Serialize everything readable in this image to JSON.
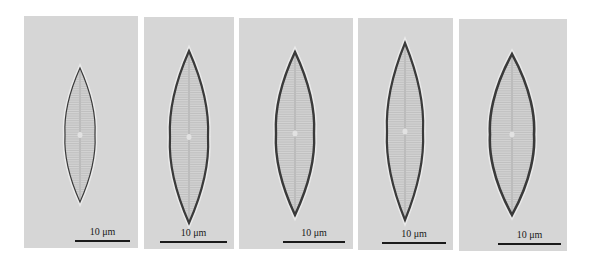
{
  "figure": {
    "background": "#ffffff",
    "panel_color": "#d6d6d6",
    "panels": [
      {
        "id": "a",
        "x": 24,
        "y": 16,
        "w": 114,
        "h": 232,
        "scale_label": "10 μm",
        "bar_x1": 75,
        "bar_x2": 130,
        "bar_y": 240,
        "cell": {
          "cx": 80,
          "top": 68,
          "bottom": 202,
          "half_w": 15,
          "stroke": 1.2
        }
      },
      {
        "id": "b",
        "x": 144,
        "y": 17,
        "w": 90,
        "h": 232,
        "scale_label": "10 μm",
        "bar_x1": 160,
        "bar_x2": 227,
        "bar_y": 241,
        "cell": {
          "cx": 189,
          "top": 51,
          "bottom": 223,
          "half_w": 19,
          "stroke": 2.2
        }
      },
      {
        "id": "c",
        "x": 239,
        "y": 18,
        "w": 114,
        "h": 231,
        "scale_label": "10 μm",
        "bar_x1": 283,
        "bar_x2": 345,
        "bar_y": 241,
        "cell": {
          "cx": 295,
          "top": 52,
          "bottom": 215,
          "half_w": 19,
          "stroke": 2.4
        }
      },
      {
        "id": "d",
        "x": 358,
        "y": 18,
        "w": 95,
        "h": 232,
        "scale_label": "10 μm",
        "bar_x1": 382,
        "bar_x2": 446,
        "bar_y": 242,
        "cell": {
          "cx": 405,
          "top": 43,
          "bottom": 220,
          "half_w": 18,
          "stroke": 2.2
        }
      },
      {
        "id": "e",
        "x": 459,
        "y": 19,
        "w": 108,
        "h": 232,
        "scale_label": "10 μm",
        "bar_x1": 498,
        "bar_x2": 561,
        "bar_y": 243,
        "cell": {
          "cx": 512,
          "top": 54,
          "bottom": 215,
          "half_w": 22,
          "stroke": 2.6
        }
      }
    ]
  }
}
